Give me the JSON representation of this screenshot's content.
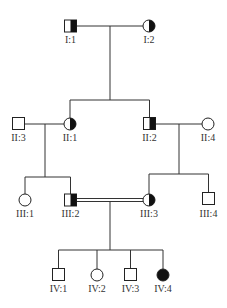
{
  "diagram": {
    "type": "pedigree-chart",
    "colors": {
      "line": "#333333",
      "affected": "#111111",
      "unaffected": "#ffffff"
    },
    "individuals": [
      {
        "id": "I:1",
        "sex": "male",
        "status": "carrier-half",
        "x": 70.5,
        "y": 26
      },
      {
        "id": "I:2",
        "sex": "female",
        "status": "carrier-half",
        "x": 149,
        "y": 26
      },
      {
        "id": "II:3",
        "sex": "male",
        "status": "unaffected",
        "x": 18.5,
        "y": 123.5
      },
      {
        "id": "II:1",
        "sex": "female",
        "status": "carrier-half",
        "x": 70,
        "y": 124
      },
      {
        "id": "II:2",
        "sex": "male",
        "status": "carrier-half",
        "x": 149.5,
        "y": 123.5
      },
      {
        "id": "II:4",
        "sex": "female",
        "status": "unaffected",
        "x": 208,
        "y": 124
      },
      {
        "id": "III:1",
        "sex": "female",
        "status": "unaffected",
        "x": 25,
        "y": 200
      },
      {
        "id": "III:2",
        "sex": "male",
        "status": "carrier-half",
        "x": 70.5,
        "y": 200
      },
      {
        "id": "III:3",
        "sex": "female",
        "status": "carrier-half",
        "x": 149,
        "y": 200
      },
      {
        "id": "III:4",
        "sex": "male",
        "status": "unaffected",
        "x": 208.5,
        "y": 198.5
      },
      {
        "id": "IV:1",
        "sex": "male",
        "status": "unaffected",
        "x": 58.5,
        "y": 274.5
      },
      {
        "id": "IV:2",
        "sex": "female",
        "status": "unaffected",
        "x": 97,
        "y": 275
      },
      {
        "id": "IV:3",
        "sex": "male",
        "status": "unaffected",
        "x": 130.5,
        "y": 274.5
      },
      {
        "id": "IV:4",
        "sex": "female",
        "status": "affected",
        "x": 163,
        "y": 275
      }
    ],
    "labels": {
      "I1": "I:1",
      "I2": "I:2",
      "II1": "II:1",
      "II2": "II:2",
      "II3": "II:3",
      "II4": "II:4",
      "III1": "III:1",
      "III2": "III:2",
      "III3": "III:3",
      "III4": "III:4",
      "IV1": "IV:1",
      "IV2": "IV:2",
      "IV3": "IV:3",
      "IV4": "IV:4"
    },
    "unions": [
      {
        "partners": [
          "I:1",
          "I:2"
        ],
        "consanguineous": false
      },
      {
        "partners": [
          "II:3",
          "II:1"
        ],
        "consanguineous": false
      },
      {
        "partners": [
          "II:2",
          "II:4"
        ],
        "consanguineous": false
      },
      {
        "partners": [
          "III:2",
          "III:3"
        ],
        "consanguineous": true
      }
    ],
    "sibships": [
      {
        "parents": [
          "I:1",
          "I:2"
        ],
        "children": [
          "II:1",
          "II:2"
        ]
      },
      {
        "parents": [
          "II:3",
          "II:1"
        ],
        "children": [
          "III:1",
          "III:2"
        ]
      },
      {
        "parents": [
          "II:2",
          "II:4"
        ],
        "children": [
          "III:3",
          "III:4"
        ]
      },
      {
        "parents": [
          "III:2",
          "III:3"
        ],
        "children": [
          "IV:1",
          "IV:2",
          "IV:3",
          "IV:4"
        ]
      }
    ]
  }
}
